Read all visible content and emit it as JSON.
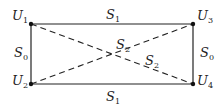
{
  "diagram": {
    "type": "network graph",
    "colors": {
      "line": "#222222",
      "background": "#ffffff"
    },
    "nodes": [
      {
        "id": "U1",
        "base": "U",
        "sub": "1",
        "x": 31,
        "y": 24
      },
      {
        "id": "U2",
        "base": "U",
        "sub": "2",
        "x": 31,
        "y": 84
      },
      {
        "id": "U3",
        "base": "U",
        "sub": "3",
        "x": 193,
        "y": 24
      },
      {
        "id": "U4",
        "base": "U",
        "sub": "4",
        "x": 193,
        "y": 84
      }
    ],
    "edges": [
      {
        "from": "U1",
        "to": "U3",
        "style": "solid",
        "label": {
          "base": "S",
          "sub": "1"
        }
      },
      {
        "from": "U2",
        "to": "U4",
        "style": "solid",
        "label": {
          "base": "S",
          "sub": "1"
        }
      },
      {
        "from": "U1",
        "to": "U2",
        "style": "solid",
        "label": {
          "base": "S",
          "sub": "0"
        }
      },
      {
        "from": "U3",
        "to": "U4",
        "style": "solid",
        "label": {
          "base": "S",
          "sub": "0"
        }
      },
      {
        "from": "U1",
        "to": "U4",
        "style": "dashed",
        "label": {
          "base": "S",
          "sub": "2"
        }
      },
      {
        "from": "U2",
        "to": "U3",
        "style": "dashed",
        "label": {
          "base": "S",
          "sub": "2"
        }
      }
    ]
  }
}
